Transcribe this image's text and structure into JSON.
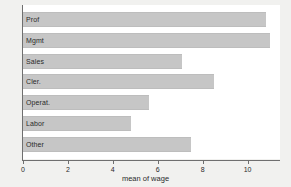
{
  "chart_data": {
    "type": "bar",
    "orientation": "horizontal",
    "title": "",
    "xlabel": "mean of wage",
    "ylabel": "",
    "categories": [
      "Prof",
      "Mgmt",
      "Sales",
      "Cler.",
      "Operat.",
      "Labor",
      "Other"
    ],
    "values": [
      10.8,
      11.0,
      7.1,
      8.5,
      5.6,
      4.8,
      7.5
    ],
    "xlim": [
      0,
      11.4
    ],
    "xticks": [
      0,
      2,
      4,
      6,
      8,
      10
    ],
    "xtick_labels": [
      "0",
      "2",
      "4",
      "6",
      "8",
      "10"
    ],
    "grid": false,
    "legend": false,
    "bar_color": "#c6c6c6",
    "axis_color": "#6f6f6f",
    "plot_background": "#ffffff",
    "figure_background": "#f1f1ef",
    "text_color": "#2a2a2a"
  }
}
